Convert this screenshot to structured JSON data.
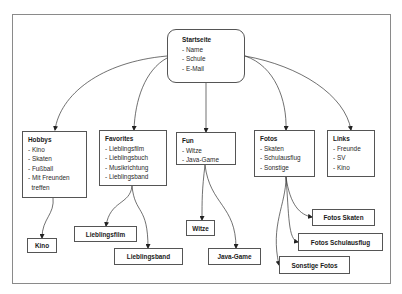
{
  "diagram": {
    "root": {
      "title": "Startseite",
      "items": [
        "- Name",
        "- Schule",
        "- E-Mail"
      ]
    },
    "sections": [
      {
        "id": "hobbys",
        "title": "Hobbys",
        "items": [
          "- Kino",
          "- Skaten",
          "- Fußball",
          "- Mit Freunden",
          "  treffen"
        ]
      },
      {
        "id": "favorites",
        "title": "Favorites",
        "items": [
          "- Lieblingsfilm",
          "- Lieblingsbuch",
          "- Musikrichtung",
          "- Lieblingsband"
        ]
      },
      {
        "id": "fun",
        "title": "Fun",
        "items": [
          "- Witze",
          "- Java-Game"
        ]
      },
      {
        "id": "fotos",
        "title": "Fotos",
        "items": [
          "- Skaten",
          "- Schulausflug",
          "- Sonstige"
        ]
      },
      {
        "id": "links",
        "title": "Links",
        "items": [
          "- Freunde",
          "- SV",
          "- Kino"
        ]
      }
    ],
    "leaves": [
      {
        "id": "kino",
        "parent": "hobbys",
        "label": "Kino"
      },
      {
        "id": "lieblingsfilm",
        "parent": "favorites",
        "label": "Lieblingsfilm"
      },
      {
        "id": "lieblingsband",
        "parent": "favorites",
        "label": "Lieblingsband"
      },
      {
        "id": "witze",
        "parent": "fun",
        "label": "Witze"
      },
      {
        "id": "java-game",
        "parent": "fun",
        "label": "Java-Game"
      },
      {
        "id": "fotos-skaten",
        "parent": "fotos",
        "label": "Fotos Skaten"
      },
      {
        "id": "fotos-schulausflug",
        "parent": "fotos",
        "label": "Fotos Schulausflug"
      },
      {
        "id": "sonstige-fotos",
        "parent": "fotos",
        "label": "Sonstige Fotos"
      }
    ]
  }
}
